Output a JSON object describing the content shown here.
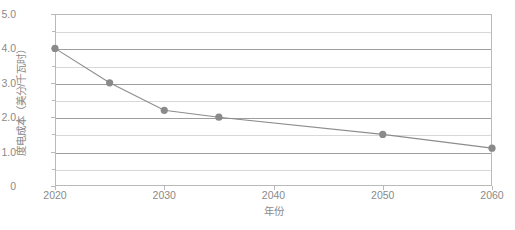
{
  "chart_data": {
    "type": "line",
    "title": "",
    "xlabel": "年份",
    "ylabel": "度电成本（美分/千瓦时）",
    "x": [
      2020,
      2025,
      2030,
      2035,
      2050,
      2060
    ],
    "values": [
      4.0,
      3.0,
      2.2,
      2.0,
      1.5,
      1.1
    ],
    "series": [
      {
        "name": "度电成本",
        "values": [
          4.0,
          3.0,
          2.2,
          2.0,
          1.5,
          1.1
        ]
      }
    ],
    "xlim": [
      2020,
      2060
    ],
    "ylim": [
      0,
      5.0
    ],
    "xticks": [
      2020,
      2030,
      2040,
      2050,
      2060
    ],
    "xtick_labels": [
      "2020",
      "2030",
      "2040",
      "2050",
      "2060"
    ],
    "yticks": [
      0,
      1.0,
      2.0,
      3.0,
      4.0,
      5.0
    ],
    "ytick_labels": [
      "0",
      "1.0",
      "2.0",
      "3.0",
      "4.0",
      "5.0"
    ],
    "y_minor_ticks": [
      0.5,
      1.5,
      2.5,
      3.5,
      4.5
    ],
    "grid": "horizontal-major-and-minor",
    "legend": "none",
    "marker": "circle",
    "colors": {
      "line": "#8c8c8c",
      "marker": "#8a8a8a",
      "grid_major": "#9e9e9e",
      "grid_minor": "#d8d8d8",
      "frame": "#b9b9b9",
      "text": "#8a8a8a",
      "background": "#ffffff"
    }
  }
}
